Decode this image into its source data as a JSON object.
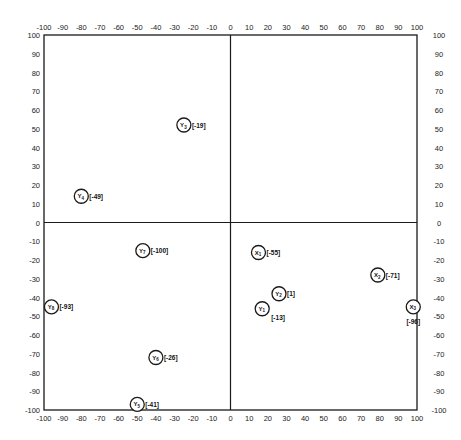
{
  "chart_data": {
    "type": "scatter",
    "title": "",
    "xlabel": "",
    "ylabel": "",
    "xlim": [
      -100,
      100
    ],
    "ylim": [
      -100,
      100
    ],
    "grid": false,
    "legend": null,
    "x_ticks": [
      -100,
      -90,
      -80,
      -70,
      -60,
      -50,
      -40,
      -30,
      -20,
      -10,
      0,
      10,
      20,
      30,
      40,
      50,
      60,
      70,
      80,
      90,
      100
    ],
    "y_ticks": [
      100,
      90,
      80,
      70,
      60,
      50,
      40,
      30,
      20,
      10,
      0,
      -10,
      -20,
      -30,
      -40,
      -50,
      -60,
      -70,
      -80,
      -90,
      -100
    ],
    "axes_through_origin": true,
    "points": [
      {
        "id": "Y3",
        "letter": "Y",
        "sub": "3",
        "x": -25,
        "y": 52,
        "bracket": "[-19]",
        "label_pos": "right"
      },
      {
        "id": "Y4",
        "letter": "Y",
        "sub": "4",
        "x": -80,
        "y": 14,
        "bracket": "[-49]",
        "label_pos": "right"
      },
      {
        "id": "Y7",
        "letter": "Y",
        "sub": "7",
        "x": -47,
        "y": -15,
        "bracket": "[-100]",
        "label_pos": "right"
      },
      {
        "id": "Y8",
        "letter": "Y",
        "sub": "8",
        "x": -96,
        "y": -45,
        "bracket": "[-93]",
        "label_pos": "right"
      },
      {
        "id": "Y6",
        "letter": "Y",
        "sub": "6",
        "x": -40,
        "y": -72,
        "bracket": "[-26]",
        "label_pos": "right"
      },
      {
        "id": "Y5",
        "letter": "Y",
        "sub": "5",
        "x": -50,
        "y": -97,
        "bracket": "[-41]",
        "label_pos": "right"
      },
      {
        "id": "X1",
        "letter": "X",
        "sub": "1",
        "x": 15,
        "y": -16,
        "bracket": "[-55]",
        "label_pos": "right"
      },
      {
        "id": "Y2",
        "letter": "Y",
        "sub": "2",
        "x": 26,
        "y": -38,
        "bracket": "[1]",
        "label_pos": "right"
      },
      {
        "id": "Y1",
        "letter": "Y",
        "sub": "1",
        "x": 17,
        "y": -46,
        "bracket": "[-13]",
        "label_pos": "below-right"
      },
      {
        "id": "X2",
        "letter": "X",
        "sub": "2",
        "x": 79,
        "y": -28,
        "bracket": "[-71]",
        "label_pos": "right"
      },
      {
        "id": "X3",
        "letter": "X",
        "sub": "3",
        "x": 98,
        "y": -45,
        "bracket": "[-96]",
        "label_pos": "below"
      }
    ]
  },
  "colors": {
    "ink": "#1a1a1a",
    "background": "#ffffff"
  }
}
